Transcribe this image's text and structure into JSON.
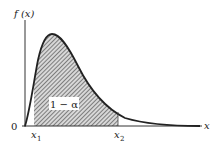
{
  "diagram": {
    "type": "probability-density-curve",
    "y_axis_label": "f (x)",
    "x_axis_label": "x",
    "origin_label": "0",
    "lower_bound_label": "x",
    "lower_bound_sub": "1",
    "upper_bound_label": "x",
    "upper_bound_sub": "2",
    "region_label": "1 − α",
    "colors": {
      "curve": "#222222",
      "axis": "#333333",
      "hatch": "#555555",
      "label_box": "#ffffff"
    }
  }
}
